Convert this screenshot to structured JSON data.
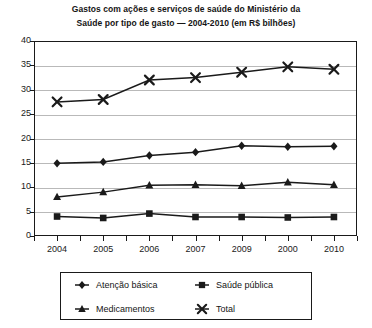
{
  "chart": {
    "title_line1": "Gastos com ações e serviços de saúde do Ministério da",
    "title_line2": "Saúde por tipo de gasto — 2004-2010 (em R$ bilhões)"
  },
  "chart_data": {
    "type": "line",
    "title": "Gastos com ações e serviços de saúde do Ministério da Saúde por tipo de gasto — 2004-2010 (em R$ bilhões)",
    "xlabel": "",
    "ylabel": "",
    "categories": [
      "2004",
      "2005",
      "2006",
      "2007",
      "2009",
      "2000",
      "2010"
    ],
    "ylim": [
      0,
      40
    ],
    "yticks": [
      0,
      5,
      10,
      15,
      20,
      25,
      30,
      35,
      40
    ],
    "grid": true,
    "legend_position": "bottom",
    "series": [
      {
        "name": "Atenção básica",
        "marker": "diamond",
        "color": "#1a1a1a",
        "values": [
          14.9,
          15.2,
          16.5,
          17.2,
          18.5,
          18.3,
          18.4
        ]
      },
      {
        "name": "Saúde pública",
        "marker": "square",
        "color": "#1a1a1a",
        "values": [
          4.0,
          3.7,
          4.6,
          3.9,
          3.9,
          3.8,
          3.9
        ]
      },
      {
        "name": "Medicamentos",
        "marker": "triangle",
        "color": "#1a1a1a",
        "values": [
          8.0,
          9.0,
          10.4,
          10.5,
          10.3,
          11.0,
          10.5
        ]
      },
      {
        "name": "Total",
        "marker": "cross",
        "color": "#1a1a1a",
        "values": [
          27.5,
          28.0,
          32.0,
          32.5,
          33.6,
          34.7,
          34.2
        ]
      }
    ]
  },
  "legend": {
    "items": [
      {
        "label": "Atenção básica",
        "marker": "diamond"
      },
      {
        "label": "Saúde pública",
        "marker": "square"
      },
      {
        "label": "Medicamentos",
        "marker": "triangle"
      },
      {
        "label": "Total",
        "marker": "cross"
      }
    ]
  }
}
